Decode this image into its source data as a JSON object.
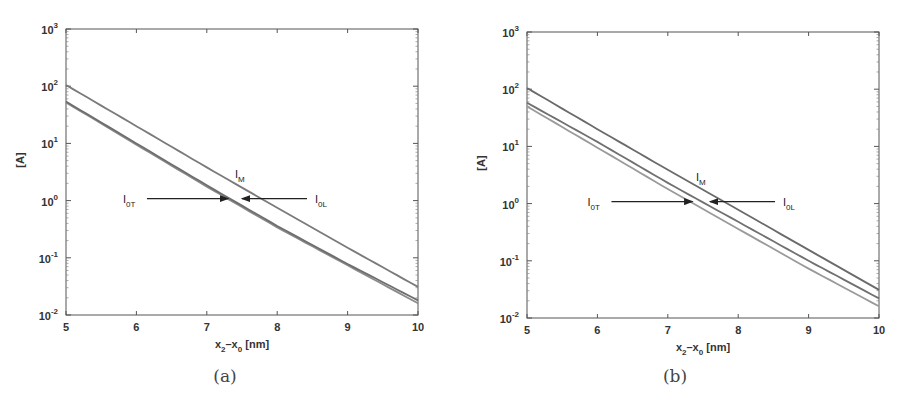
{
  "figure": {
    "panels": [
      {
        "id": "a",
        "caption": "(a)"
      },
      {
        "id": "b",
        "caption": "(b)"
      }
    ]
  },
  "chart_data": [
    {
      "type": "line",
      "panel": "(a)",
      "title": "",
      "xlabel": "x2-x0 [nm]",
      "ylabel": "[A]",
      "xlim": [
        5,
        10
      ],
      "ylim": [
        0.01,
        1000
      ],
      "yscale": "log",
      "grid": false,
      "x_ticks": [
        "5",
        "6",
        "7",
        "8",
        "9",
        "10"
      ],
      "y_ticks": [
        "10^-2",
        "10^-1",
        "10^0",
        "10^1",
        "10^2",
        "10^3"
      ],
      "x": [
        5,
        6,
        7,
        8,
        9,
        10
      ],
      "series": [
        {
          "name": "I_M",
          "values": [
            105,
            20,
            3.8,
            0.75,
            0.15,
            0.031
          ],
          "color": "#7a7a7a"
        },
        {
          "name": "I_0T",
          "values": [
            52,
            9.5,
            1.75,
            0.34,
            0.074,
            0.016
          ],
          "color": "#8a8a8a"
        },
        {
          "name": "I_0L",
          "values": [
            54,
            10,
            1.85,
            0.36,
            0.078,
            0.018
          ],
          "color": "#6e6e6e"
        }
      ],
      "annotations": [
        {
          "text": "I_M",
          "x": 7.4,
          "y": 2.5
        },
        {
          "text": "I_0T",
          "arrow_to_x": 7.3,
          "y": 1.0
        },
        {
          "text": "I_0L",
          "arrow_to_x": 7.5,
          "y": 1.0
        }
      ]
    },
    {
      "type": "line",
      "panel": "(b)",
      "title": "",
      "xlabel": "x2-x0 [nm]",
      "ylabel": "[A]",
      "xlim": [
        5,
        10
      ],
      "ylim": [
        0.01,
        1000
      ],
      "yscale": "log",
      "grid": false,
      "x_ticks": [
        "5",
        "6",
        "7",
        "8",
        "9",
        "10"
      ],
      "y_ticks": [
        "10^-2",
        "10^-1",
        "10^0",
        "10^1",
        "10^2",
        "10^3"
      ],
      "x": [
        5,
        6,
        7,
        8,
        9,
        10
      ],
      "series": [
        {
          "name": "I_M",
          "values": [
            105,
            20,
            3.9,
            0.78,
            0.155,
            0.031
          ],
          "color": "#6a6a6a"
        },
        {
          "name": "I_0L",
          "values": [
            58,
            12,
            2.3,
            0.48,
            0.1,
            0.022
          ],
          "color": "#707070"
        },
        {
          "name": "I_0T",
          "values": [
            50,
            9.5,
            1.8,
            0.36,
            0.073,
            0.016
          ],
          "color": "#9a9a9a"
        }
      ],
      "annotations": [
        {
          "text": "I_M",
          "x": 7.4,
          "y": 2.5
        },
        {
          "text": "I_0T",
          "arrow_to_x": 7.35,
          "y": 1.0
        },
        {
          "text": "I_0L",
          "arrow_to_x": 7.6,
          "y": 1.0
        }
      ]
    }
  ],
  "labels": {
    "x_axis_main": "x",
    "x_axis_sub1": "2",
    "x_axis_mid": "–x",
    "x_axis_sub2": "0",
    "x_axis_unit": " [nm]",
    "y_axis": "[A]",
    "ten": "10",
    "exp": [
      "-2",
      "-1",
      "0",
      "1",
      "2",
      "3"
    ],
    "xticks": [
      "5",
      "6",
      "7",
      "8",
      "9",
      "10"
    ],
    "im_main": "I",
    "im_sub": "M",
    "i0t_main": "I",
    "i0t_sub": "0T",
    "i0l_main": "I",
    "i0l_sub": "0L"
  }
}
